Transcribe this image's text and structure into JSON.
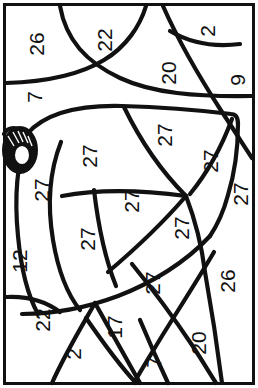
{
  "page": {
    "kind": "color-by-number-coloring-page",
    "orientation_note": "rotated 90 degrees clockwise",
    "width": 258,
    "height": 388,
    "background_color": "#ffffff",
    "line_color": "#111111",
    "border_color": "#111111"
  },
  "regions": [
    {
      "id": "r-top-left-26",
      "number": "26",
      "x": 36,
      "y": 44
    },
    {
      "id": "r-top-22",
      "number": "22",
      "x": 104,
      "y": 40
    },
    {
      "id": "r-top-right-2",
      "number": "2",
      "x": 207,
      "y": 31
    },
    {
      "id": "r-top-20",
      "number": "20",
      "x": 168,
      "y": 73
    },
    {
      "id": "r-right-9",
      "number": "9",
      "x": 237,
      "y": 80
    },
    {
      "id": "r-left-7",
      "number": "7",
      "x": 34,
      "y": 97
    },
    {
      "id": "r-bell-body-27a",
      "number": "27",
      "x": 89,
      "y": 156
    },
    {
      "id": "r-bell-body-27b",
      "number": "27",
      "x": 164,
      "y": 135
    },
    {
      "id": "r-bell-right-27c",
      "number": "27",
      "x": 210,
      "y": 161
    },
    {
      "id": "r-bell-clapper-27d",
      "number": "27",
      "x": 240,
      "y": 194
    },
    {
      "id": "r-bell-left-27e",
      "number": "27",
      "x": 41,
      "y": 190
    },
    {
      "id": "r-bell-mid-27f",
      "number": "27",
      "x": 131,
      "y": 201
    },
    {
      "id": "r-bell-lower-27g",
      "number": "27",
      "x": 87,
      "y": 239
    },
    {
      "id": "r-bell-lower-27h",
      "number": "27",
      "x": 181,
      "y": 228
    },
    {
      "id": "r-bell-lower-27i",
      "number": "27",
      "x": 152,
      "y": 283
    },
    {
      "id": "r-left-12",
      "number": "12",
      "x": 19,
      "y": 261
    },
    {
      "id": "r-right-26",
      "number": "26",
      "x": 227,
      "y": 281
    },
    {
      "id": "r-bottom-left-22",
      "number": "22",
      "x": 42,
      "y": 320
    },
    {
      "id": "r-bottom-17",
      "number": "17",
      "x": 114,
      "y": 327
    },
    {
      "id": "r-bottom-2",
      "number": "2",
      "x": 73,
      "y": 354
    },
    {
      "id": "r-bottom-7",
      "number": "7",
      "x": 153,
      "y": 362
    },
    {
      "id": "r-bottom-20",
      "number": "20",
      "x": 198,
      "y": 343
    }
  ],
  "palette_numbers_used": [
    "2",
    "7",
    "9",
    "12",
    "17",
    "20",
    "22",
    "26",
    "27"
  ]
}
